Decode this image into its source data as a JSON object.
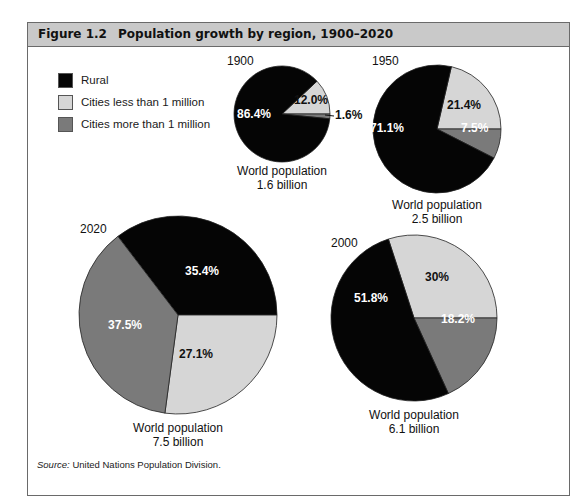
{
  "header": {
    "figure_number": "Figure 1.2",
    "title": "Population growth by region, 1900–2020"
  },
  "legend": [
    {
      "label": "Rural",
      "color": "#050505"
    },
    {
      "label": "Cities less than 1 million",
      "color": "#d6d6d6"
    },
    {
      "label": "Cities more than 1 million",
      "color": "#7a7a7a"
    }
  ],
  "source": {
    "label": "Source:",
    "text": " United Nations Population Division."
  },
  "chart_data": [
    {
      "type": "pie",
      "title": "1900",
      "caption_line1": "World population",
      "caption_line2": "1.6 billion",
      "categories": [
        "Rural",
        "Cities less than 1 million",
        "Cities more than 1 million"
      ],
      "values": [
        86.4,
        12.0,
        1.6
      ],
      "labels": [
        "86.4%",
        "12.0%",
        "1.6%"
      ]
    },
    {
      "type": "pie",
      "title": "1950",
      "caption_line1": "World population",
      "caption_line2": "2.5 billion",
      "categories": [
        "Rural",
        "Cities less than 1 million",
        "Cities more than 1 million"
      ],
      "values": [
        71.1,
        21.4,
        7.5
      ],
      "labels": [
        "71.1%",
        "21.4%",
        "7.5%"
      ]
    },
    {
      "type": "pie",
      "title": "2000",
      "caption_line1": "World population",
      "caption_line2": "6.1 billion",
      "categories": [
        "Rural",
        "Cities less than 1 million",
        "Cities more than 1 million"
      ],
      "values": [
        51.8,
        30.0,
        18.2
      ],
      "labels": [
        "51.8%",
        "30%",
        "18.2%"
      ]
    },
    {
      "type": "pie",
      "title": "2020",
      "caption_line1": "World population",
      "caption_line2": "7.5 billion",
      "categories": [
        "Rural",
        "Cities less than 1 million",
        "Cities more than 1 million"
      ],
      "values": [
        35.4,
        27.1,
        37.5
      ],
      "labels": [
        "35.4%",
        "27.1%",
        "37.5%"
      ]
    }
  ]
}
